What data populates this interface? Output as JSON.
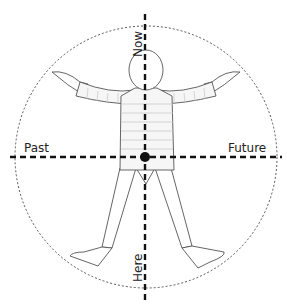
{
  "diagram": {
    "labels": {
      "top": "Now",
      "bottom": "Here",
      "left": "Past",
      "right": "Future"
    },
    "colors": {
      "line": "#111111",
      "figure_stroke": "#555555",
      "figure_fill": "#f4f4f4",
      "circle": "#444444"
    }
  }
}
